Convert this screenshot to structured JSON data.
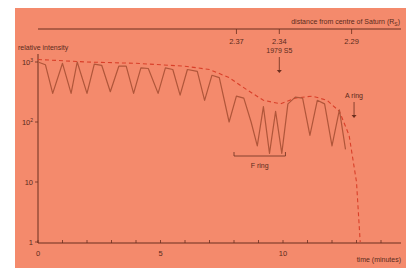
{
  "chart_data": {
    "type": "line",
    "title": "",
    "xlabel": "time (minutes)",
    "ylabel": "relative intensity",
    "yscale": "log",
    "ylim": [
      1,
      1500
    ],
    "xlim": [
      0,
      14
    ],
    "x_ticks": [
      "0",
      "5",
      "10"
    ],
    "y_ticks": [
      "1",
      "10",
      "10²",
      "10³"
    ],
    "top_axis": {
      "label": "distance from centre of Saturn (Rₛ)",
      "label_text": "distance from centre of Saturn (R",
      "label_sub": "S",
      "label_close": ")",
      "ticks": [
        {
          "label": "2.37",
          "time": 8.1
        },
        {
          "label": "2.34",
          "time": 9.85
        },
        {
          "label": "2.29",
          "time": 12.8
        }
      ]
    },
    "annotations": [
      {
        "text": "1979 S5",
        "type": "arrow",
        "time": 9.85
      },
      {
        "text": "A ring",
        "type": "arrow",
        "time": 12.9
      },
      {
        "text": "F ring",
        "type": "bracket",
        "range": [
          8.0,
          10.1
        ]
      }
    ],
    "series": [
      {
        "name": "measured intensity",
        "style": "solid",
        "color": "#b0563a",
        "x": [
          0.0,
          0.3,
          0.6,
          1.0,
          1.35,
          1.6,
          2.0,
          2.3,
          2.6,
          2.95,
          3.3,
          3.6,
          3.9,
          4.2,
          4.5,
          4.9,
          5.2,
          5.5,
          5.8,
          6.1,
          6.5,
          6.8,
          7.1,
          7.4,
          7.8,
          8.1,
          8.4,
          8.7,
          8.95,
          9.2,
          9.45,
          9.7,
          9.95,
          10.2,
          10.5,
          10.8,
          11.1,
          11.4,
          11.7,
          12.0,
          12.3,
          12.55
        ],
        "values": [
          1000,
          900,
          300,
          950,
          300,
          1000,
          300,
          920,
          880,
          320,
          850,
          850,
          300,
          800,
          780,
          300,
          800,
          750,
          280,
          750,
          700,
          230,
          600,
          550,
          100,
          270,
          250,
          100,
          40,
          180,
          30,
          150,
          30,
          200,
          260,
          250,
          60,
          230,
          200,
          40,
          160,
          35
        ]
      },
      {
        "name": "envelope (dashed)",
        "style": "dashed",
        "color": "#d9402a",
        "x": [
          0.0,
          2.0,
          4.0,
          6.0,
          7.0,
          7.8,
          8.5,
          9.2,
          9.9,
          10.5,
          11.2,
          11.8,
          12.3,
          12.7,
          13.0,
          13.15
        ],
        "values": [
          1100,
          1000,
          950,
          850,
          750,
          550,
          350,
          230,
          200,
          250,
          270,
          230,
          150,
          60,
          10,
          1
        ]
      }
    ]
  }
}
